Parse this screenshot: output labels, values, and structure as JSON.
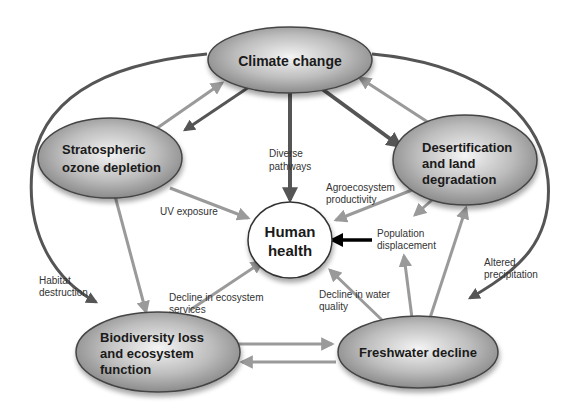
{
  "nodes": {
    "climate": {
      "label": "Climate change"
    },
    "ozone": {
      "line1": "Stratospheric",
      "line2": "ozone depletion"
    },
    "desert": {
      "line1": "Desertification",
      "line2": "and land",
      "line3": "degradation"
    },
    "health": {
      "line1": "Human",
      "line2": "health"
    },
    "biodiv": {
      "line1": "Biodiversity loss",
      "line2": "and ecosystem",
      "line3": "function"
    },
    "fresh": {
      "label": "Freshwater decline"
    }
  },
  "edge_labels": {
    "diverse": {
      "line1": "Diverse",
      "line2": "pathways"
    },
    "agro": {
      "line1": "Agroecosystem",
      "line2": "productivity"
    },
    "uv": {
      "line1": "UV exposure"
    },
    "population": {
      "line1": "Population",
      "line2": "displacement"
    },
    "habitat": {
      "line1": "Habitat",
      "line2": "destruction"
    },
    "eco_services": {
      "line1": "Decline in ecosystem",
      "line2": "services"
    },
    "water_quality": {
      "line1": "Decline in water",
      "line2": "quality"
    },
    "precip": {
      "line1": "Altered",
      "line2": "precipitation"
    }
  },
  "colors": {
    "dark_arrow": "#555555",
    "light_arrow": "#9a9a9a",
    "black_arrow": "#000000",
    "node_center": "#f2f2f2",
    "node_edge": "#7a7a7a"
  }
}
